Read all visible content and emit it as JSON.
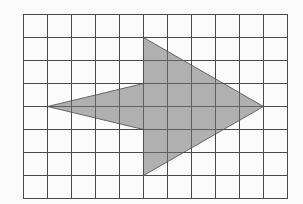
{
  "diagram": {
    "type": "grid-shape",
    "grid": {
      "columns": 11,
      "rows": 8,
      "origin_px": [
        23,
        14
      ],
      "cell_width_px": 24,
      "cell_height_px": 23
    },
    "shape": {
      "name": "arrow",
      "direction": "right",
      "vertices_grid": [
        [
          5,
          1
        ],
        [
          10,
          4
        ],
        [
          5,
          7
        ],
        [
          5,
          5
        ],
        [
          1,
          4
        ],
        [
          5,
          3
        ]
      ]
    },
    "colors": {
      "background": "#fbfbfb",
      "grid_line": "#4a4a4a",
      "shape_fill": "#a9a9a9",
      "shape_stroke": "#666666"
    }
  }
}
